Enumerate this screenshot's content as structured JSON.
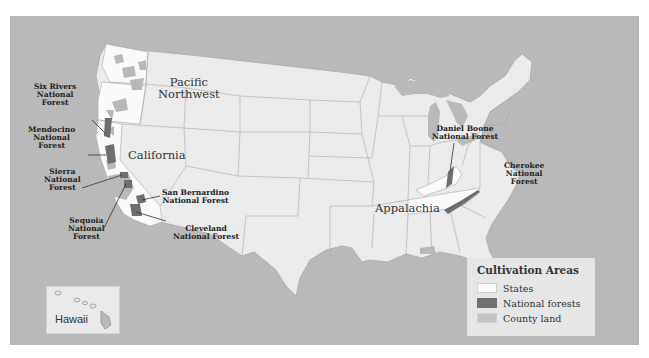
{
  "map": {
    "colors": {
      "water": "#b9b9b9",
      "states": "#ebebeb",
      "cultivation_states": "#fafafa",
      "national_forests": "#707070",
      "county_land": "#b8b8b8",
      "border": "#a8a8a8"
    },
    "regions": [
      {
        "id": "pacific-northwest",
        "label": "Pacific\nNorthwest"
      },
      {
        "id": "california",
        "label": "California"
      },
      {
        "id": "appalachia",
        "label": "Appalachia"
      }
    ],
    "forests": [
      {
        "id": "six-rivers",
        "label": "Six Rivers\nNational\nForest"
      },
      {
        "id": "mendocino",
        "label": "Mendocino\nNational\nForest"
      },
      {
        "id": "sierra",
        "label": "Sierra\nNational\nForest"
      },
      {
        "id": "sequoia",
        "label": "Sequoia\nNational\nForest"
      },
      {
        "id": "san-bernardino",
        "label": "San Bernardino\nNational Forest"
      },
      {
        "id": "cleveland",
        "label": "Cleveland\nNational Forest"
      },
      {
        "id": "daniel-boone",
        "label": "Daniel Boone\nNational Forest"
      },
      {
        "id": "cherokee",
        "label": "Cherokee\nNational\nForest"
      }
    ],
    "inset": {
      "label": "Hawaii"
    }
  },
  "legend": {
    "title": "Cultivation Areas",
    "items": [
      {
        "label": "States",
        "color": "#fafafa"
      },
      {
        "label": "National forests",
        "color": "#707070"
      },
      {
        "label": "County land",
        "color": "#b8b8b8"
      }
    ]
  }
}
